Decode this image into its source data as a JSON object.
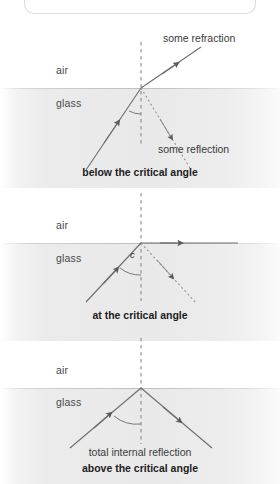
{
  "figure": {
    "title_box": "",
    "media": {
      "upper": "air",
      "lower": "glass"
    },
    "colors": {
      "ray": "#6e6e6e",
      "ray_dark": "#4a4a4a",
      "normal_dash": "#8a8a8a",
      "glass_fill": "#e9e9e9",
      "text": "#3a3a3a",
      "caption": "#1d1d1d",
      "box_border": "#dcdcdc"
    },
    "panels": [
      {
        "id": "below-critical-angle",
        "caption": "below the critical angle",
        "caption_bold": true,
        "sub_caption": "",
        "air_label": "air",
        "glass_label": "glass",
        "angle_label": "",
        "labels": [
          {
            "name": "refracted-ray-label",
            "text": "some refraction"
          },
          {
            "name": "reflected-ray-label",
            "text": "some reflection"
          }
        ],
        "rays": [
          {
            "name": "incident-ray",
            "style": "solid",
            "desc": "incident ray travelling up-right through glass to interface"
          },
          {
            "name": "refracted-ray",
            "style": "solid",
            "desc": "refracted ray bending away from normal into air"
          },
          {
            "name": "reflected-ray",
            "style": "dotted",
            "desc": "weak partially reflected ray back into glass"
          },
          {
            "name": "normal-line",
            "style": "dashed",
            "desc": "normal to the interface"
          }
        ]
      },
      {
        "id": "at-critical-angle",
        "caption": "at the critical angle",
        "caption_bold": true,
        "sub_caption": "",
        "air_label": "air",
        "glass_label": "glass",
        "angle_label": "c",
        "labels": [],
        "rays": [
          {
            "name": "incident-ray",
            "style": "solid",
            "desc": "incident ray at the critical angle"
          },
          {
            "name": "refracted-ray",
            "style": "solid",
            "desc": "refracted ray grazing along the interface at 90 degrees"
          },
          {
            "name": "reflected-ray",
            "style": "dotted",
            "desc": "weak reflected ray back into glass"
          },
          {
            "name": "normal-line",
            "style": "dashed",
            "desc": "normal to the interface"
          }
        ]
      },
      {
        "id": "above-critical-angle",
        "caption": "above the critical angle",
        "caption_bold": true,
        "sub_caption": "total internal reflection",
        "air_label": "air",
        "glass_label": "glass",
        "angle_label": "",
        "labels": [],
        "rays": [
          {
            "name": "incident-ray",
            "style": "solid",
            "desc": "incident ray above the critical angle"
          },
          {
            "name": "reflected-ray",
            "style": "solid",
            "desc": "fully reflected ray back into glass"
          },
          {
            "name": "normal-line",
            "style": "dashed",
            "desc": "normal to the interface"
          }
        ]
      }
    ]
  }
}
